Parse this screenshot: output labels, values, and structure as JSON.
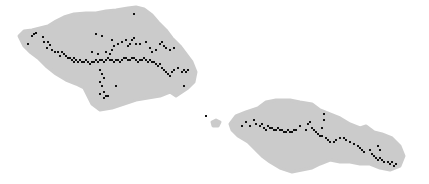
{
  "map": {
    "width": 429,
    "height": 184,
    "background": "#ffffff",
    "land_color": "#cbcbcb",
    "point_color": "#111111",
    "islands": [
      {
        "name": "savaii",
        "path": "M19,36 L24,31 L32,30 L40,28 L48,26 L56,21 L64,17 L74,14 L86,13 L96,13 L106,11 L116,10 L128,8 L136,7 L144,9 L152,15 L158,22 L166,30 L172,38 L180,46 L186,54 L192,62 L196,72 L194,82 L188,88 L182,92 L176,96 L170,92 L160,96 L148,98 L136,100 L124,104 L112,108 L100,110 L92,104 L88,96 L84,88 L76,84 L66,80 L56,74 L46,66 L38,58 L30,52 L24,46 Z"
      },
      {
        "name": "upolu",
        "path": "M230,124 L236,116 L246,112 L258,108 L266,102 L276,100 L290,100 L300,102 L312,104 L320,110 L330,114 L340,118 L350,124 L360,128 L366,126 L374,132 L382,134 L392,138 L400,146 L404,156 L400,166 L390,170 L380,168 L370,164 L360,164 L350,162 L340,162 L330,160 L320,164 L312,168 L302,170 L292,172 L280,168 L270,162 L262,156 L256,150 L248,142 L238,136 L232,130 Z"
      },
      {
        "name": "islet",
        "path": "M212,122 L216,120 L220,122 L218,126 L213,126 Z"
      }
    ],
    "points": [
      [
        32,
        36
      ],
      [
        34,
        34
      ],
      [
        36,
        33
      ],
      [
        28,
        44
      ],
      [
        43,
        37
      ],
      [
        44,
        42
      ],
      [
        48,
        42
      ],
      [
        50,
        45
      ],
      [
        47,
        48
      ],
      [
        52,
        50
      ],
      [
        55,
        52
      ],
      [
        58,
        52
      ],
      [
        62,
        52
      ],
      [
        64,
        54
      ],
      [
        60,
        56
      ],
      [
        66,
        56
      ],
      [
        68,
        58
      ],
      [
        70,
        58
      ],
      [
        72,
        60
      ],
      [
        74,
        58
      ],
      [
        76,
        60
      ],
      [
        78,
        62
      ],
      [
        74,
        62
      ],
      [
        80,
        60
      ],
      [
        82,
        62
      ],
      [
        84,
        62
      ],
      [
        86,
        60
      ],
      [
        88,
        62
      ],
      [
        90,
        64
      ],
      [
        92,
        62
      ],
      [
        94,
        62
      ],
      [
        96,
        60
      ],
      [
        98,
        62
      ],
      [
        100,
        60
      ],
      [
        102,
        60
      ],
      [
        104,
        62
      ],
      [
        106,
        60
      ],
      [
        108,
        58
      ],
      [
        110,
        60
      ],
      [
        112,
        60
      ],
      [
        114,
        62
      ],
      [
        116,
        60
      ],
      [
        118,
        60
      ],
      [
        120,
        62
      ],
      [
        122,
        60
      ],
      [
        124,
        58
      ],
      [
        126,
        58
      ],
      [
        128,
        60
      ],
      [
        130,
        60
      ],
      [
        132,
        58
      ],
      [
        134,
        58
      ],
      [
        136,
        60
      ],
      [
        138,
        62
      ],
      [
        140,
        60
      ],
      [
        142,
        60
      ],
      [
        144,
        58
      ],
      [
        146,
        60
      ],
      [
        148,
        62
      ],
      [
        150,
        60
      ],
      [
        152,
        62
      ],
      [
        154,
        62
      ],
      [
        156,
        64
      ],
      [
        158,
        66
      ],
      [
        160,
        64
      ],
      [
        162,
        68
      ],
      [
        164,
        70
      ],
      [
        166,
        72
      ],
      [
        168,
        74
      ],
      [
        170,
        76
      ],
      [
        172,
        72
      ],
      [
        174,
        70
      ],
      [
        178,
        68
      ],
      [
        182,
        72
      ],
      [
        184,
        70
      ],
      [
        186,
        72
      ],
      [
        188,
        70
      ],
      [
        184,
        86
      ],
      [
        96,
        34
      ],
      [
        102,
        36
      ],
      [
        92,
        52
      ],
      [
        98,
        54
      ],
      [
        106,
        52
      ],
      [
        110,
        54
      ],
      [
        112,
        50
      ],
      [
        114,
        46
      ],
      [
        112,
        40
      ],
      [
        118,
        44
      ],
      [
        122,
        42
      ],
      [
        126,
        40
      ],
      [
        128,
        46
      ],
      [
        130,
        44
      ],
      [
        132,
        40
      ],
      [
        134,
        38
      ],
      [
        136,
        44
      ],
      [
        140,
        44
      ],
      [
        146,
        42
      ],
      [
        150,
        48
      ],
      [
        152,
        52
      ],
      [
        156,
        50
      ],
      [
        160,
        44
      ],
      [
        162,
        42
      ],
      [
        164,
        46
      ],
      [
        166,
        48
      ],
      [
        170,
        50
      ],
      [
        174,
        48
      ],
      [
        100,
        70
      ],
      [
        102,
        74
      ],
      [
        104,
        78
      ],
      [
        100,
        82
      ],
      [
        102,
        86
      ],
      [
        104,
        92
      ],
      [
        106,
        96
      ],
      [
        104,
        98
      ],
      [
        100,
        94
      ],
      [
        108,
        96
      ],
      [
        116,
        86
      ],
      [
        134,
        14
      ],
      [
        206,
        116
      ],
      [
        242,
        126
      ],
      [
        246,
        122
      ],
      [
        250,
        126
      ],
      [
        254,
        120
      ],
      [
        256,
        124
      ],
      [
        260,
        126
      ],
      [
        262,
        124
      ],
      [
        264,
        128
      ],
      [
        266,
        130
      ],
      [
        268,
        126
      ],
      [
        270,
        128
      ],
      [
        272,
        128
      ],
      [
        274,
        130
      ],
      [
        276,
        130
      ],
      [
        278,
        128
      ],
      [
        280,
        130
      ],
      [
        282,
        130
      ],
      [
        284,
        132
      ],
      [
        286,
        132
      ],
      [
        288,
        130
      ],
      [
        290,
        132
      ],
      [
        292,
        132
      ],
      [
        294,
        130
      ],
      [
        296,
        130
      ],
      [
        300,
        126
      ],
      [
        306,
        130
      ],
      [
        308,
        124
      ],
      [
        310,
        122
      ],
      [
        312,
        128
      ],
      [
        314,
        130
      ],
      [
        316,
        132
      ],
      [
        318,
        134
      ],
      [
        320,
        136
      ],
      [
        322,
        136
      ],
      [
        326,
        138
      ],
      [
        328,
        140
      ],
      [
        330,
        142
      ],
      [
        334,
        142
      ],
      [
        336,
        140
      ],
      [
        340,
        138
      ],
      [
        344,
        138
      ],
      [
        346,
        140
      ],
      [
        350,
        142
      ],
      [
        354,
        144
      ],
      [
        358,
        146
      ],
      [
        360,
        148
      ],
      [
        362,
        150
      ],
      [
        364,
        152
      ],
      [
        370,
        150
      ],
      [
        372,
        154
      ],
      [
        374,
        156
      ],
      [
        376,
        158
      ],
      [
        378,
        160
      ],
      [
        380,
        158
      ],
      [
        382,
        160
      ],
      [
        384,
        162
      ],
      [
        388,
        162
      ],
      [
        390,
        164
      ],
      [
        392,
        162
      ],
      [
        394,
        166
      ],
      [
        396,
        164
      ],
      [
        322,
        128
      ],
      [
        324,
        120
      ],
      [
        324,
        114
      ],
      [
        378,
        146
      ],
      [
        380,
        150
      ]
    ]
  }
}
